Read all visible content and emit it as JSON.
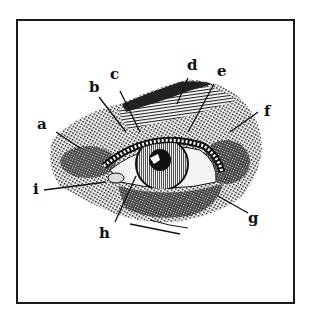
{
  "diagram": {
    "labels": [
      {
        "id": "a",
        "text": "a"
      },
      {
        "id": "b",
        "text": "b"
      },
      {
        "id": "c",
        "text": "c"
      },
      {
        "id": "d",
        "text": "d"
      },
      {
        "id": "e",
        "text": "e"
      },
      {
        "id": "f",
        "text": "f"
      },
      {
        "id": "g",
        "text": "g"
      },
      {
        "id": "h",
        "text": "h"
      },
      {
        "id": "i",
        "text": "i"
      }
    ],
    "colors": {
      "ink": "#111111",
      "paper": "#ffffff"
    }
  }
}
